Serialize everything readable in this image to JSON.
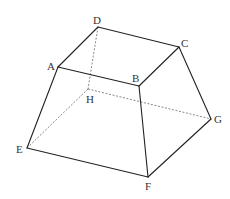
{
  "diagram": {
    "type": "frustum",
    "vertices": {
      "A": {
        "label": "A",
        "x": 58,
        "y": 67,
        "lx": 47,
        "ly": 70
      },
      "B": {
        "label": "B",
        "x": 139,
        "y": 86,
        "lx": 132,
        "ly": 82
      },
      "C": {
        "label": "C",
        "x": 179,
        "y": 47,
        "lx": 181,
        "ly": 47
      },
      "D": {
        "label": "D",
        "x": 98,
        "y": 27,
        "lx": 93,
        "ly": 24
      },
      "E": {
        "label": "E",
        "x": 27,
        "y": 148,
        "lx": 16,
        "ly": 153
      },
      "F": {
        "label": "F",
        "x": 148,
        "y": 177,
        "lx": 145,
        "ly": 190
      },
      "G": {
        "label": "G",
        "x": 211,
        "y": 119,
        "lx": 214,
        "ly": 123
      },
      "H": {
        "label": "H",
        "x": 88,
        "y": 89,
        "lx": 86,
        "ly": 103
      }
    },
    "visible_edges": [
      [
        "A",
        "B"
      ],
      [
        "B",
        "C"
      ],
      [
        "C",
        "D"
      ],
      [
        "D",
        "A"
      ],
      [
        "A",
        "E"
      ],
      [
        "B",
        "F"
      ],
      [
        "C",
        "G"
      ],
      [
        "E",
        "F"
      ],
      [
        "F",
        "G"
      ]
    ],
    "hidden_edges": [
      [
        "D",
        "H"
      ],
      [
        "H",
        "E"
      ],
      [
        "H",
        "G"
      ]
    ],
    "colors": {
      "edge": "#222222",
      "hidden_edge": "#555555",
      "label": "#333333",
      "background": "#ffffff"
    }
  }
}
